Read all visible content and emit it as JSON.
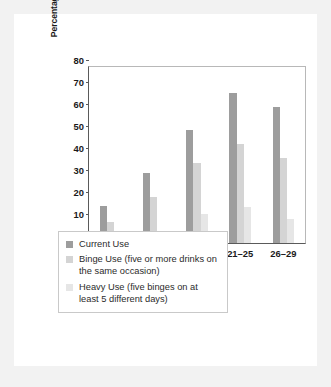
{
  "chart_data": {
    "type": "bar",
    "title": "",
    "xlabel": "Age in Years",
    "ylabel": "Percentages Using in Past Month",
    "categories": [
      "14–15",
      "16–17",
      "18–20",
      "21–25",
      "26–29"
    ],
    "ylim": [
      0,
      80
    ],
    "yticks": [
      0,
      10,
      20,
      30,
      40,
      50,
      60,
      70,
      80
    ],
    "grid": false,
    "legend_position": "below-axes",
    "series": [
      {
        "name": "Current Use",
        "color": "#9d9d9d",
        "values": [
          17,
          32,
          51.5,
          68,
          62
        ]
      },
      {
        "name": "Binge Use (five or more drinks on the same occasion)",
        "color": "#d4d4d4",
        "values": [
          9.5,
          21,
          36.5,
          45,
          38.5
        ]
      },
      {
        "name": "Heavy Use (five binges on at least 5 different days)",
        "color": "#e6e6e6",
        "values": [
          2,
          5.5,
          13,
          16.5,
          11
        ]
      }
    ]
  },
  "legend": {
    "items": [
      {
        "label": "Current Use",
        "color": "#9d9d9d"
      },
      {
        "label": "Binge Use (five or more drinks on the same occasion)",
        "color": "#d4d4d4"
      },
      {
        "label": "Heavy Use (five binges on at least 5 different days)",
        "color": "#e6e6e6"
      }
    ]
  },
  "colors": {
    "page_background": "#f2f2f2",
    "card_background": "#ffffff",
    "axis": "#5a5a5a",
    "text": "#1a1a1a"
  }
}
